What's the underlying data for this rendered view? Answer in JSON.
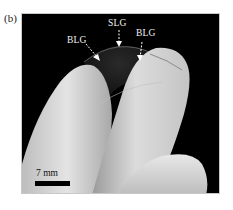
{
  "figure": {
    "panel_label": "(b)",
    "annotations": [
      {
        "label": "BLG",
        "meaning": "bilayer graphene region (left)"
      },
      {
        "label": "SLG",
        "meaning": "single-layer graphene region (center)"
      },
      {
        "label": "BLG",
        "meaning": "bilayer graphene region (right)"
      }
    ],
    "scale_bar": {
      "label": "7 mm"
    },
    "colors": {
      "background": "#000000",
      "glove": "#d8d8d8",
      "annotation_text": "#f2f2f2",
      "scale_bar": "#000000"
    }
  }
}
